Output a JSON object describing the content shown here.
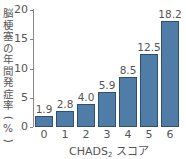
{
  "chart_data": {
    "type": "bar",
    "title": "",
    "xlabel": "CHADS2 スコア",
    "xlabel_main": "CHADS",
    "xlabel_sub": "2",
    "xlabel_suffix": " スコア",
    "ylabel": "脳梗塞の年間発症率（%）",
    "ylabel_chars": [
      "脳",
      "梗",
      "塞",
      "の",
      "年",
      "間",
      "発",
      "症",
      "率",
      "(",
      "%",
      ")"
    ],
    "categories": [
      "0",
      "1",
      "2",
      "3",
      "4",
      "5",
      "6"
    ],
    "values": [
      1.9,
      2.8,
      4.0,
      5.9,
      8.5,
      12.5,
      18.2
    ],
    "value_labels": [
      "1.9",
      "2.8",
      "4.0",
      "5.9",
      "8.5",
      "12.5",
      "18.2"
    ],
    "yticks": [
      "0",
      "5",
      "10",
      "15",
      "20"
    ],
    "ylim": [
      0,
      20
    ],
    "grid": false,
    "bar_color": "#4f7da8",
    "bar_edge_color": "#2f4f6f"
  }
}
